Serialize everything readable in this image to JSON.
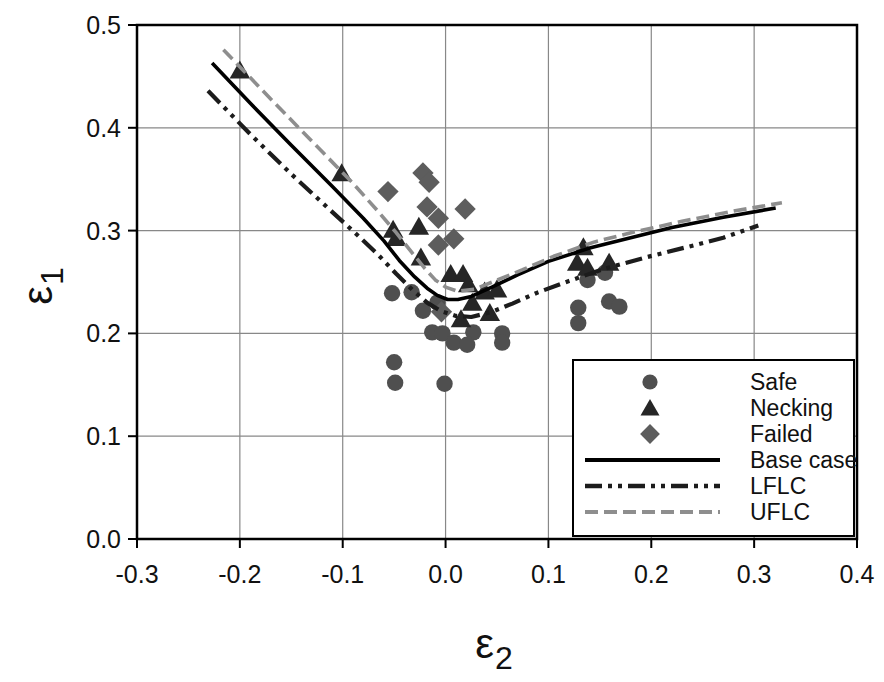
{
  "figure": {
    "title": "",
    "ylabel_base": "ε",
    "ylabel_sub": "1",
    "xlabel_base": "ε",
    "xlabel_sub": "2"
  },
  "legend": {
    "position": "inside-bottom-right",
    "items": [
      {
        "label": "Safe",
        "series": "Safe"
      },
      {
        "label": "Necking",
        "series": "Necking"
      },
      {
        "label": "Failed",
        "series": "Failed"
      },
      {
        "label": "Base case",
        "series": "Base case"
      },
      {
        "label": "LFLC",
        "series": "LFLC"
      },
      {
        "label": "UFLC",
        "series": "UFLC"
      }
    ]
  },
  "colors": {
    "background": "#ffffff",
    "text": "#111111",
    "axis": "#000000",
    "grid": "#888888",
    "safe_marker": "#4f4f4f",
    "necking_marker": "#262626",
    "failed_marker": "#5d5d5d",
    "base_line": "#000000",
    "lflc_line": "#1c1c1c",
    "uflc_line": "#8e8e8e"
  },
  "chart_data": {
    "type": "scatter",
    "title": "",
    "xlabel": "ε2",
    "ylabel": "ε1",
    "xlim": [
      -0.3,
      0.4
    ],
    "ylim": [
      0.0,
      0.5
    ],
    "x_ticks": [
      -0.3,
      -0.2,
      -0.1,
      0.0,
      0.1,
      0.2,
      0.3,
      0.4
    ],
    "x_tick_labels": [
      "-0.3",
      "-0.2",
      "-0.1",
      "0.0",
      "0.1",
      "0.2",
      "0.3",
      "0.4"
    ],
    "y_ticks": [
      0.0,
      0.1,
      0.2,
      0.3,
      0.4,
      0.5
    ],
    "y_tick_labels": [
      "0.0",
      "0.1",
      "0.2",
      "0.3",
      "0.4",
      "0.5"
    ],
    "grid": true,
    "legend_position": "inside-bottom-right",
    "series": [
      {
        "name": "Safe",
        "kind": "scatter",
        "marker": "circle",
        "color": "#4f4f4f",
        "points": [
          [
            -0.052,
            0.239
          ],
          [
            -0.033,
            0.24
          ],
          [
            -0.022,
            0.222
          ],
          [
            -0.008,
            0.23
          ],
          [
            -0.013,
            0.201
          ],
          [
            -0.003,
            0.2
          ],
          [
            0.027,
            0.201
          ],
          [
            0.055,
            0.2
          ],
          [
            0.008,
            0.191
          ],
          [
            0.021,
            0.189
          ],
          [
            0.055,
            0.191
          ],
          [
            -0.05,
            0.172
          ],
          [
            -0.049,
            0.152
          ],
          [
            -0.001,
            0.151
          ],
          [
            0.138,
            0.252
          ],
          [
            0.155,
            0.259
          ],
          [
            0.129,
            0.225
          ],
          [
            0.129,
            0.21
          ],
          [
            0.159,
            0.231
          ],
          [
            0.169,
            0.226
          ]
        ]
      },
      {
        "name": "Necking",
        "kind": "scatter",
        "marker": "triangle",
        "color": "#262626",
        "points": [
          [
            -0.2,
            0.456
          ],
          [
            -0.101,
            0.356
          ],
          [
            -0.051,
            0.301
          ],
          [
            -0.048,
            0.293
          ],
          [
            -0.026,
            0.304
          ],
          [
            -0.024,
            0.274
          ],
          [
            0.005,
            0.258
          ],
          [
            0.017,
            0.258
          ],
          [
            0.022,
            0.248
          ],
          [
            0.038,
            0.241
          ],
          [
            0.05,
            0.243
          ],
          [
            0.026,
            0.23
          ],
          [
            0.043,
            0.22
          ],
          [
            0.015,
            0.214
          ],
          [
            0.134,
            0.284
          ],
          [
            0.128,
            0.269
          ],
          [
            0.138,
            0.264
          ],
          [
            0.159,
            0.269
          ]
        ]
      },
      {
        "name": "Failed",
        "kind": "scatter",
        "marker": "diamond",
        "color": "#5d5d5d",
        "points": [
          [
            -0.056,
            0.338
          ],
          [
            -0.022,
            0.356
          ],
          [
            -0.016,
            0.347
          ],
          [
            -0.018,
            0.323
          ],
          [
            -0.007,
            0.312
          ],
          [
            0.019,
            0.321
          ],
          [
            -0.007,
            0.286
          ],
          [
            0.008,
            0.292
          ],
          [
            -0.004,
            0.221
          ]
        ]
      },
      {
        "name": "Base case",
        "kind": "line",
        "style": "solid",
        "color": "#000000",
        "width": 3.6,
        "points": [
          [
            -0.227,
            0.463
          ],
          [
            -0.19,
            0.424
          ],
          [
            -0.15,
            0.383
          ],
          [
            -0.11,
            0.343
          ],
          [
            -0.08,
            0.312
          ],
          [
            -0.06,
            0.29
          ],
          [
            -0.045,
            0.271
          ],
          [
            -0.03,
            0.255
          ],
          [
            -0.018,
            0.244
          ],
          [
            -0.008,
            0.237
          ],
          [
            0.002,
            0.233
          ],
          [
            0.012,
            0.233
          ],
          [
            0.025,
            0.236
          ],
          [
            0.045,
            0.245
          ],
          [
            0.07,
            0.257
          ],
          [
            0.1,
            0.27
          ],
          [
            0.14,
            0.283
          ],
          [
            0.18,
            0.293
          ],
          [
            0.22,
            0.303
          ],
          [
            0.27,
            0.313
          ],
          [
            0.321,
            0.322
          ]
        ]
      },
      {
        "name": "LFLC",
        "kind": "line",
        "style": "dash-dot-dot",
        "color": "#1c1c1c",
        "width": 4.2,
        "dash": [
          17,
          6,
          4,
          6,
          4,
          6
        ],
        "points": [
          [
            -0.231,
            0.436
          ],
          [
            -0.19,
            0.394
          ],
          [
            -0.15,
            0.355
          ],
          [
            -0.11,
            0.318
          ],
          [
            -0.085,
            0.295
          ],
          [
            -0.065,
            0.276
          ],
          [
            -0.048,
            0.258
          ],
          [
            -0.032,
            0.242
          ],
          [
            -0.018,
            0.23
          ],
          [
            -0.005,
            0.222
          ],
          [
            0.01,
            0.217
          ],
          [
            0.025,
            0.216
          ],
          [
            0.045,
            0.221
          ],
          [
            0.065,
            0.229
          ],
          [
            0.09,
            0.24
          ],
          [
            0.12,
            0.251
          ],
          [
            0.155,
            0.263
          ],
          [
            0.195,
            0.274
          ],
          [
            0.235,
            0.284
          ],
          [
            0.27,
            0.293
          ],
          [
            0.304,
            0.305
          ]
        ]
      },
      {
        "name": "UFLC",
        "kind": "line",
        "style": "dashed",
        "color": "#8e8e8e",
        "width": 3.6,
        "dash": [
          13,
          6
        ],
        "points": [
          [
            -0.216,
            0.476
          ],
          [
            -0.17,
            0.428
          ],
          [
            -0.13,
            0.387
          ],
          [
            -0.09,
            0.346
          ],
          [
            -0.065,
            0.318
          ],
          [
            -0.048,
            0.298
          ],
          [
            -0.033,
            0.279
          ],
          [
            -0.02,
            0.263
          ],
          [
            -0.01,
            0.252
          ],
          [
            0.0,
            0.245
          ],
          [
            0.012,
            0.241
          ],
          [
            0.028,
            0.243
          ],
          [
            0.048,
            0.251
          ],
          [
            0.075,
            0.262
          ],
          [
            0.105,
            0.275
          ],
          [
            0.145,
            0.289
          ],
          [
            0.185,
            0.299
          ],
          [
            0.23,
            0.309
          ],
          [
            0.28,
            0.319
          ],
          [
            0.327,
            0.327
          ]
        ]
      }
    ]
  }
}
